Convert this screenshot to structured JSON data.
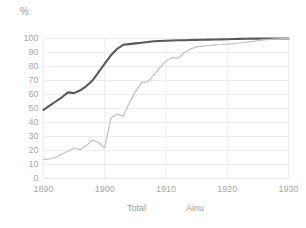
{
  "chart_data": {
    "type": "line",
    "title": "",
    "subtitle": "",
    "xlabel": "",
    "ylabel": "%",
    "xlim": [
      1890,
      1930
    ],
    "ylim": [
      0,
      100
    ],
    "grid": true,
    "legend_position": "bottom",
    "x_ticks": [
      "1890",
      "1900",
      "1910",
      "1920",
      "1930"
    ],
    "y_ticks": [
      "100",
      "90",
      "80",
      "70",
      "60",
      "50",
      "40",
      "30",
      "20",
      "10",
      "0"
    ],
    "x": [
      1890,
      1891,
      1892,
      1893,
      1894,
      1895,
      1896,
      1897,
      1898,
      1899,
      1900,
      1901,
      1902,
      1903,
      1904,
      1905,
      1906,
      1907,
      1908,
      1909,
      1910,
      1911,
      1912,
      1913,
      1914,
      1915,
      1916,
      1917,
      1918,
      1919,
      1920,
      1921,
      1922,
      1923,
      1924,
      1925,
      1926,
      1927,
      1928,
      1929,
      1930
    ],
    "series": [
      {
        "name": "Total",
        "color": "#595959",
        "width": 2.1,
        "values": [
          49,
          52,
          55,
          58,
          61.5,
          61,
          63,
          66,
          70,
          76,
          82,
          88,
          92.5,
          95.5,
          96,
          96.5,
          97,
          97.5,
          98,
          98.2,
          98.4,
          98.6,
          98.7,
          98.8,
          98.9,
          99,
          99.1,
          99.2,
          99.3,
          99.4,
          99.5,
          99.6,
          99.7,
          99.8,
          99.9,
          99.9,
          100,
          100,
          100,
          100,
          100
        ]
      },
      {
        "name": "Ainu",
        "color": "#bfbfbf",
        "width": 1.2,
        "values": [
          13.5,
          14,
          15,
          17.5,
          19.5,
          22,
          20.5,
          23.5,
          27.5,
          25.5,
          22,
          43,
          46,
          44.5,
          54,
          62,
          68.5,
          69,
          74,
          79,
          84,
          86.5,
          86,
          90,
          92.5,
          94,
          94.5,
          95,
          95.5,
          95.7,
          96,
          96.3,
          96.8,
          97.2,
          97.8,
          98.4,
          99,
          99.4,
          99.7,
          99.9,
          100
        ]
      }
    ]
  },
  "legend": {
    "items": [
      {
        "label": "Total"
      },
      {
        "label": "Ainu"
      }
    ]
  },
  "colors": {
    "total_line": "#595959",
    "ainu_line": "#bfbfbf",
    "grid": "#e8e8e8",
    "tick_text": "#a6a6a6"
  }
}
